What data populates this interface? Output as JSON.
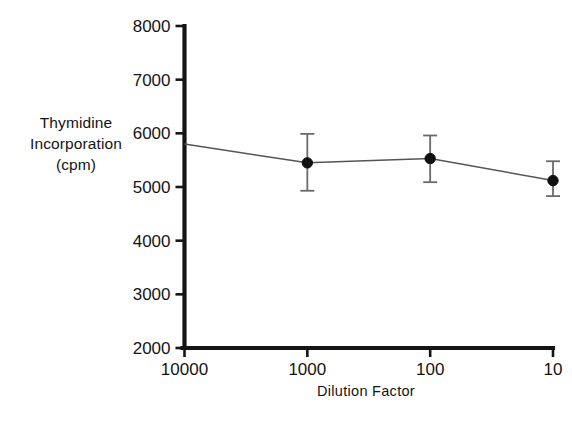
{
  "chart_data": {
    "type": "line",
    "title": "",
    "subtitle": "",
    "xlabel": "Dilution Factor",
    "ylabel": "Thymidine Incorporation (cpm)",
    "ylabel_lines": [
      "Thymidine",
      "Incorporation",
      "(cpm)"
    ],
    "x": [
      1000,
      100,
      10
    ],
    "x_ticklabels": [
      "10000",
      "1000",
      "100",
      "10"
    ],
    "x_tickvalues": [
      10000,
      1000,
      100,
      10
    ],
    "xscale": "log-reversed",
    "xlim": [
      10000,
      10
    ],
    "y_ticklabels": [
      "8000",
      "7000",
      "6000",
      "5000",
      "4000",
      "3000",
      "2000"
    ],
    "y_tickvalues": [
      8000,
      7000,
      6000,
      5000,
      4000,
      3000,
      2000
    ],
    "ylim": [
      2000,
      8000
    ],
    "grid": false,
    "legend": false,
    "legend_position": "none",
    "series": [
      {
        "name": "Thymidine Incorporation",
        "marker": "filled-circle",
        "color": "#111111",
        "line_color": "#555555",
        "values": [
          5450,
          5530,
          5120
        ],
        "errors_upper": [
          5990,
          5960,
          5480
        ],
        "errors_lower": [
          4930,
          5090,
          4830
        ],
        "line_origin": {
          "x": 10000,
          "y": 5800
        }
      }
    ],
    "annotations": []
  },
  "axis_titles": {
    "y_line1": "Thymidine",
    "y_line2": "Incorporation",
    "y_line3": "(cpm)",
    "x": "Dilution Factor"
  },
  "ticks": {
    "y": [
      {
        "label": "8000",
        "value": 8000
      },
      {
        "label": "7000",
        "value": 7000
      },
      {
        "label": "6000",
        "value": 6000
      },
      {
        "label": "5000",
        "value": 5000
      },
      {
        "label": "4000",
        "value": 4000
      },
      {
        "label": "3000",
        "value": 3000
      },
      {
        "label": "2000",
        "value": 2000
      }
    ],
    "x": [
      {
        "label": "10000",
        "value": 10000
      },
      {
        "label": "1000",
        "value": 1000
      },
      {
        "label": "100",
        "value": 100
      },
      {
        "label": "10",
        "value": 10
      }
    ]
  },
  "colors": {
    "background": "#ffffff",
    "axis": "#151515",
    "data_line": "#5a5a5a",
    "marker": "#111111",
    "errorbar": "#6a6a6a",
    "text": "#141414"
  }
}
